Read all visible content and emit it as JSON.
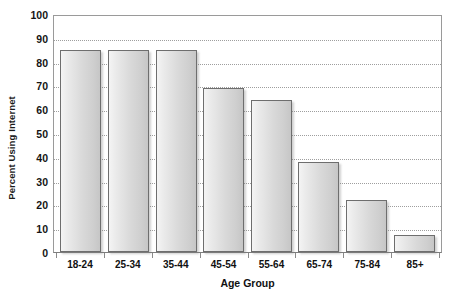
{
  "chart_data": {
    "type": "bar",
    "title": "",
    "subtitle": "",
    "xlabel": "Age Group",
    "ylabel": "Percent Using Internet",
    "categories": [
      "18-24",
      "25-34",
      "35-44",
      "45-54",
      "55-64",
      "65-74",
      "75-84",
      "85+"
    ],
    "values": [
      85,
      85,
      85,
      69,
      64,
      38,
      22,
      7
    ],
    "series": [
      {
        "name": "Percent Using Internet",
        "values": [
          85,
          85,
          85,
          69,
          64,
          38,
          22,
          7
        ]
      }
    ],
    "ylim": [
      0,
      100
    ],
    "ytick_labels": [
      "100",
      "90",
      "80",
      "70",
      "60",
      "50",
      "40",
      "30",
      "20",
      "10",
      "0"
    ],
    "ytick_values": [
      100,
      90,
      80,
      70,
      60,
      50,
      40,
      30,
      20,
      10,
      0
    ],
    "grid": "horizontal-dotted",
    "legend": "none",
    "legend_position": "",
    "annotations": [],
    "colors": {
      "bar_fill_light": "#f4f4f4",
      "bar_fill_dark": "#c6c6c6",
      "bar_border": "#6e6e6e",
      "gridline": "#9e9e9e",
      "axis": "#8a8a8a",
      "text": "#111111",
      "background": "#ffffff"
    }
  }
}
